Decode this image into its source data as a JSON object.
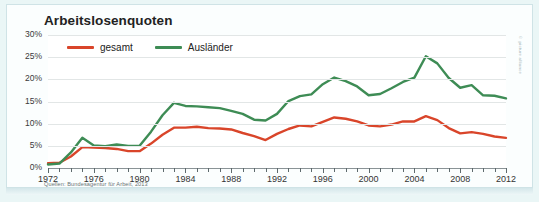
{
  "chart_data": {
    "type": "line",
    "title": "Arbeitslosenquoten",
    "xlabel": "",
    "ylabel": "",
    "ylim": [
      0,
      30
    ],
    "xlim": [
      1972,
      2012
    ],
    "grid": true,
    "legend_position": "top-left",
    "ytick_labels": [
      "30%",
      "25%",
      "20%",
      "15%",
      "10%",
      "5%",
      "0%"
    ],
    "ytick_values": [
      30,
      25,
      20,
      15,
      10,
      5,
      0
    ],
    "xtick_labels": [
      "1972",
      "1976",
      "1980",
      "1984",
      "1988",
      "1992",
      "1996",
      "2000",
      "2004",
      "2008",
      "2012"
    ],
    "xtick_values": [
      1972,
      1976,
      1980,
      1984,
      1988,
      1992,
      1996,
      2000,
      2004,
      2008,
      2012
    ],
    "x": [
      1972,
      1973,
      1974,
      1975,
      1976,
      1977,
      1978,
      1979,
      1980,
      1981,
      1982,
      1983,
      1984,
      1985,
      1986,
      1987,
      1988,
      1989,
      1990,
      1991,
      1992,
      1993,
      1994,
      1995,
      1996,
      1997,
      1998,
      1999,
      2000,
      2001,
      2002,
      2003,
      2004,
      2005,
      2006,
      2007,
      2008,
      2009,
      2010,
      2011,
      2012
    ],
    "series": [
      {
        "name": "gesamt",
        "color": "#d9452a",
        "values": [
          1.1,
          1.2,
          2.6,
          4.7,
          4.6,
          4.5,
          4.3,
          3.8,
          3.8,
          5.5,
          7.5,
          9.1,
          9.1,
          9.3,
          9.0,
          8.9,
          8.7,
          7.9,
          7.2,
          6.3,
          7.7,
          8.8,
          9.6,
          9.4,
          10.4,
          11.4,
          11.1,
          10.5,
          9.6,
          9.4,
          9.8,
          10.5,
          10.5,
          11.7,
          10.8,
          9.0,
          7.8,
          8.1,
          7.7,
          7.1,
          6.8
        ]
      },
      {
        "name": "Ausländer",
        "color": "#3e8c55",
        "values": [
          0.8,
          1.0,
          3.5,
          6.8,
          5.1,
          4.9,
          5.3,
          5.0,
          5.0,
          8.2,
          11.9,
          14.7,
          14.0,
          13.9,
          13.7,
          13.5,
          12.9,
          12.2,
          10.9,
          10.7,
          12.2,
          15.1,
          16.2,
          16.6,
          18.9,
          20.4,
          19.6,
          18.4,
          16.4,
          16.7,
          18.0,
          19.4,
          20.4,
          25.2,
          23.6,
          20.3,
          18.1,
          18.7,
          16.4,
          16.3,
          15.7
        ]
      }
    ],
    "source": "Quellen: Bundesagentur für Arbeit, 2013",
    "watermark": "© picture alliance"
  },
  "legend": {
    "items": [
      {
        "label": "gesamt",
        "color": "#d9452a"
      },
      {
        "label": "Ausländer",
        "color": "#3e8c55"
      }
    ]
  }
}
